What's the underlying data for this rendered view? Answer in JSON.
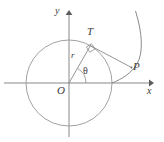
{
  "figure": {
    "kind": "geometry-diagram",
    "background_color": "#ffffff",
    "stroke_color": "#8a8a8a",
    "axis_color": "#7a7a7a",
    "label_color": "#3a3a3a"
  },
  "labels": {
    "y_axis": "y",
    "x_axis": "x",
    "origin": "O",
    "tangent_point": "T",
    "curve_point": "P",
    "radius": "r",
    "angle": "θ"
  },
  "geometry": {
    "origin": {
      "x": 69,
      "y": 83
    },
    "circle": {
      "cx": 69,
      "cy": 83,
      "r": 43
    },
    "x_axis": {
      "x1": 4,
      "y1": 83,
      "x2": 152,
      "y2": 83
    },
    "y_axis": {
      "x1": 69,
      "y1": 136,
      "x2": 69,
      "y2": 11
    },
    "point_T": {
      "x": 90,
      "y": 45
    },
    "point_P": {
      "x": 131,
      "y": 68
    },
    "radius_segment": {
      "x1": 69,
      "y1": 83,
      "x2": 90,
      "y2": 45
    },
    "tangent_segment": {
      "x1": 90,
      "y1": 45,
      "x2": 131,
      "y2": 68
    },
    "angle_arc": {
      "cx": 69,
      "cy": 83,
      "radius": 17,
      "start_deg": 0,
      "end_deg": 61
    },
    "right_angle_mark": {
      "x": 90,
      "y": 45,
      "size": 5
    },
    "involute_curve": {
      "start": {
        "x": 112,
        "y": 83
      },
      "end": {
        "x": 135,
        "y": 11
      },
      "through_P": {
        "x": 131,
        "y": 68
      }
    }
  }
}
